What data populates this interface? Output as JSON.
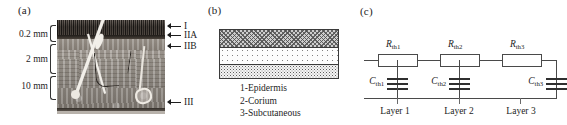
{
  "figure": {
    "panels": [
      {
        "id": "a",
        "label": "(a)",
        "name": "skin-cross-section-photograph",
        "depth_labels": [
          "0.2 mm",
          "2 mm",
          "10 mm"
        ],
        "layer_callouts": [
          "I",
          "IIA",
          "IIB",
          "III"
        ]
      },
      {
        "id": "b",
        "label": "(b)",
        "name": "three-layer-skin-model",
        "layers": [
          {
            "index": 1,
            "pattern": "crosshatch",
            "fill": "#cdcdcd"
          },
          {
            "index": 2,
            "pattern": "sparse-dots",
            "fill": "#fdfdfd"
          },
          {
            "index": 3,
            "pattern": "dense-stipple",
            "fill": "#f4f4f4"
          }
        ],
        "legend": [
          "1-Epidermis",
          "2-Corium",
          "3-Subcutaneous"
        ]
      },
      {
        "id": "c",
        "label": "(c)",
        "name": "thermal-equivalent-rc-network",
        "stages": [
          {
            "resistor": "R",
            "resistor_sub": "th1",
            "capacitor": "C",
            "capacitor_sub": "th1",
            "layer_name": "Layer 1"
          },
          {
            "resistor": "R",
            "resistor_sub": "th2",
            "capacitor": "C",
            "capacitor_sub": "th2",
            "layer_name": "Layer 2"
          },
          {
            "resistor": "R",
            "resistor_sub": "th3",
            "capacitor": "C",
            "capacitor_sub": "th3",
            "layer_name": "Layer 3"
          }
        ]
      }
    ]
  },
  "colors": {
    "ink": "#1d1d1d",
    "wire": "#4a4a4a",
    "plate": "#2f2f2f",
    "hatch": "#505050"
  }
}
